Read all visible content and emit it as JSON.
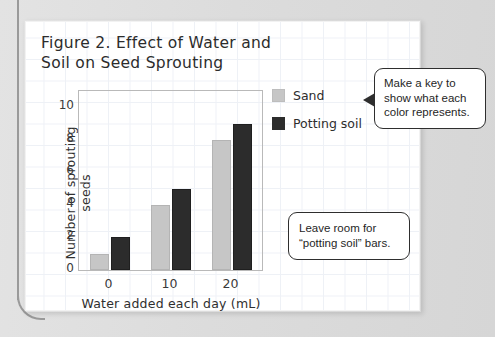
{
  "figure": {
    "title_line1": "Figure 2. Effect of Water and",
    "title_line2": "Soil on Seed Sprouting"
  },
  "legend": {
    "items": [
      {
        "label": "Sand",
        "color": "#c6c6c6",
        "swatch_name": "sand-swatch"
      },
      {
        "label": "Potting soil",
        "color": "#2c2c2c",
        "swatch_name": "potting-soil-swatch"
      }
    ]
  },
  "callouts": [
    {
      "id": "key",
      "line1": "Make a key to",
      "line2": "show what each",
      "line3": "color represents.",
      "has_arrow": true
    },
    {
      "id": "room",
      "line1": "Leave room for",
      "line2": "“potting soil” bars.",
      "line3": "",
      "has_arrow": false
    }
  ],
  "chart_data": {
    "type": "bar",
    "title": "Figure 2. Effect of Water and Soil on Seed Sprouting",
    "xlabel": "Water added each day (mL)",
    "ylabel": "Number of sprouting seeds",
    "categories": [
      "0",
      "10",
      "20"
    ],
    "xticks": [
      "0",
      "10",
      "20"
    ],
    "yticks": [
      "0",
      "2",
      "4",
      "6",
      "8",
      "10"
    ],
    "ylim": [
      0,
      11
    ],
    "grid": false,
    "legend_position": "right",
    "series": [
      {
        "name": "Sand",
        "color": "#c6c6c6",
        "values": [
          1,
          4,
          8
        ]
      },
      {
        "name": "Potting soil",
        "color": "#2c2c2c",
        "values": [
          2,
          5,
          9
        ]
      }
    ]
  }
}
